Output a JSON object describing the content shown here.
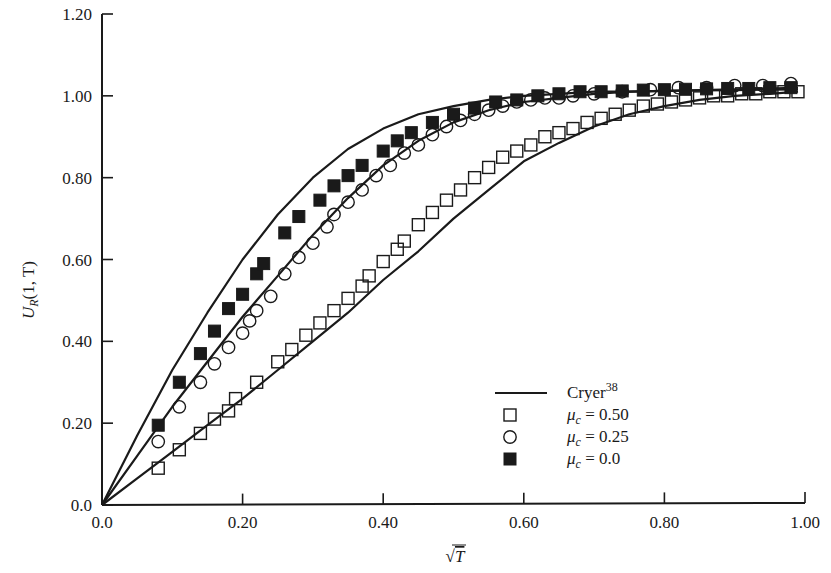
{
  "chart_data": {
    "type": "line",
    "title": "",
    "xlabel": "√T",
    "ylabel": "U_R(1, T)",
    "xlim": [
      0.0,
      1.0
    ],
    "ylim": [
      0.0,
      1.2
    ],
    "grid": false,
    "legend_position": "lower right (inside plot)",
    "x_ticks": [
      "0.0",
      "0.20",
      "0.40",
      "0.60",
      "0.80",
      "1.00"
    ],
    "x_tick_values": [
      0.0,
      0.2,
      0.4,
      0.6,
      0.8,
      1.0
    ],
    "y_ticks": [
      "0.0",
      "0.20",
      "0.40",
      "0.60",
      "0.80",
      "1.00",
      "1.20"
    ],
    "y_tick_values": [
      0.0,
      0.2,
      0.4,
      0.6,
      0.8,
      1.0,
      1.2
    ],
    "series": [
      {
        "name": "Cryer 38 (analytical, mu_c = 0.0)",
        "style": "solid-line",
        "x": [
          0.0,
          0.05,
          0.1,
          0.15,
          0.2,
          0.25,
          0.3,
          0.35,
          0.4,
          0.45,
          0.5,
          0.55,
          0.6,
          0.65,
          0.7,
          0.75,
          0.8,
          0.85,
          0.9,
          0.95,
          0.99
        ],
        "y": [
          0.0,
          0.17,
          0.33,
          0.47,
          0.6,
          0.71,
          0.8,
          0.87,
          0.92,
          0.955,
          0.975,
          0.99,
          1.0,
          1.005,
          1.01,
          1.01,
          1.012,
          1.013,
          1.014,
          1.015,
          1.016
        ]
      },
      {
        "name": "Cryer 38 (analytical, mu_c = 0.25)",
        "style": "solid-line",
        "x": [
          0.0,
          0.05,
          0.1,
          0.15,
          0.2,
          0.25,
          0.3,
          0.35,
          0.4,
          0.45,
          0.5,
          0.55,
          0.6,
          0.65,
          0.7,
          0.75,
          0.8,
          0.85,
          0.9,
          0.95,
          0.99
        ],
        "y": [
          0.0,
          0.12,
          0.24,
          0.35,
          0.46,
          0.56,
          0.66,
          0.75,
          0.83,
          0.89,
          0.935,
          0.965,
          0.985,
          0.995,
          1.005,
          1.01,
          1.012,
          1.014,
          1.016,
          1.018,
          1.02
        ]
      },
      {
        "name": "Cryer 38 (analytical, mu_c = 0.50)",
        "style": "solid-line",
        "x": [
          0.0,
          0.05,
          0.1,
          0.15,
          0.2,
          0.25,
          0.3,
          0.35,
          0.4,
          0.45,
          0.5,
          0.55,
          0.6,
          0.65,
          0.7,
          0.75,
          0.8,
          0.85,
          0.9,
          0.95,
          0.99
        ],
        "y": [
          0.0,
          0.065,
          0.13,
          0.195,
          0.26,
          0.33,
          0.4,
          0.47,
          0.55,
          0.62,
          0.7,
          0.77,
          0.84,
          0.885,
          0.925,
          0.955,
          0.975,
          0.99,
          1.0,
          1.005,
          1.01
        ]
      },
      {
        "name": "mu_c = 0.50",
        "marker": "open-square",
        "x": [
          0.08,
          0.11,
          0.14,
          0.16,
          0.18,
          0.19,
          0.22,
          0.25,
          0.27,
          0.29,
          0.31,
          0.33,
          0.35,
          0.37,
          0.38,
          0.4,
          0.42,
          0.43,
          0.45,
          0.47,
          0.49,
          0.51,
          0.53,
          0.55,
          0.57,
          0.59,
          0.61,
          0.63,
          0.65,
          0.67,
          0.69,
          0.71,
          0.73,
          0.75,
          0.77,
          0.79,
          0.81,
          0.83,
          0.85,
          0.87,
          0.89,
          0.91,
          0.93,
          0.95,
          0.97,
          0.99
        ],
        "y": [
          0.09,
          0.135,
          0.175,
          0.21,
          0.23,
          0.26,
          0.3,
          0.35,
          0.38,
          0.415,
          0.445,
          0.475,
          0.505,
          0.535,
          0.56,
          0.595,
          0.625,
          0.645,
          0.685,
          0.715,
          0.745,
          0.77,
          0.8,
          0.825,
          0.85,
          0.865,
          0.88,
          0.9,
          0.91,
          0.92,
          0.935,
          0.945,
          0.955,
          0.965,
          0.975,
          0.98,
          0.985,
          0.99,
          0.995,
          1.0,
          1.0,
          1.005,
          1.005,
          1.01,
          1.01,
          1.01
        ]
      },
      {
        "name": "mu_c = 0.25",
        "marker": "open-circle",
        "x": [
          0.08,
          0.11,
          0.14,
          0.16,
          0.18,
          0.2,
          0.21,
          0.22,
          0.24,
          0.26,
          0.28,
          0.3,
          0.32,
          0.33,
          0.35,
          0.37,
          0.39,
          0.41,
          0.43,
          0.45,
          0.47,
          0.49,
          0.51,
          0.53,
          0.55,
          0.57,
          0.59,
          0.61,
          0.63,
          0.65,
          0.67,
          0.7,
          0.74,
          0.78,
          0.82,
          0.86,
          0.9,
          0.94,
          0.98
        ],
        "y": [
          0.155,
          0.24,
          0.3,
          0.345,
          0.385,
          0.42,
          0.45,
          0.475,
          0.51,
          0.565,
          0.605,
          0.64,
          0.68,
          0.71,
          0.74,
          0.77,
          0.805,
          0.83,
          0.86,
          0.88,
          0.905,
          0.925,
          0.94,
          0.955,
          0.965,
          0.975,
          0.985,
          0.99,
          0.995,
          0.995,
          1.0,
          1.005,
          1.01,
          1.015,
          1.02,
          1.02,
          1.025,
          1.025,
          1.03
        ]
      },
      {
        "name": "mu_c = 0.0",
        "marker": "filled-square",
        "x": [
          0.08,
          0.11,
          0.14,
          0.16,
          0.18,
          0.2,
          0.22,
          0.23,
          0.26,
          0.28,
          0.31,
          0.33,
          0.35,
          0.37,
          0.4,
          0.42,
          0.44,
          0.47,
          0.5,
          0.53,
          0.56,
          0.59,
          0.62,
          0.65,
          0.68,
          0.71,
          0.74,
          0.77,
          0.8,
          0.83,
          0.86,
          0.89,
          0.92,
          0.95,
          0.98
        ],
        "y": [
          0.195,
          0.3,
          0.37,
          0.425,
          0.48,
          0.515,
          0.565,
          0.59,
          0.665,
          0.705,
          0.745,
          0.78,
          0.805,
          0.83,
          0.865,
          0.89,
          0.91,
          0.935,
          0.955,
          0.97,
          0.985,
          0.99,
          1.0,
          1.005,
          1.01,
          1.01,
          1.012,
          1.014,
          1.015,
          1.016,
          1.017,
          1.018,
          1.018,
          1.02,
          1.02
        ]
      }
    ]
  },
  "legend": {
    "items": [
      {
        "symbol": "line",
        "label": "Cryer",
        "superscript": "38"
      },
      {
        "symbol": "open-square",
        "label_var": "μ",
        "label_sub": "c",
        "label_rest": " = 0.50"
      },
      {
        "symbol": "open-circle",
        "label_var": "μ",
        "label_sub": "c",
        "label_rest": " = 0.25"
      },
      {
        "symbol": "filled-square",
        "label_var": "μ",
        "label_sub": "c",
        "label_rest": " = 0.0"
      }
    ]
  },
  "axes": {
    "x_title": "T",
    "x_title_prefix": "√",
    "y_title_main": "U",
    "y_title_sub": "R",
    "y_title_rest": "(1, T)"
  },
  "colors": {
    "ink": "#1a1a1a",
    "background": "#ffffff"
  }
}
